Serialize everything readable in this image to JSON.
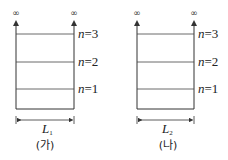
{
  "diagrams": [
    {
      "caption": "(가)",
      "width_label": "L",
      "width_sub": "1",
      "top_symbol": "∞",
      "levels": [
        {
          "n": "n",
          "eq": "=3"
        },
        {
          "n": "n",
          "eq": "=2"
        },
        {
          "n": "n",
          "eq": "=1"
        }
      ]
    },
    {
      "caption": "(나)",
      "width_label": "L",
      "width_sub": "2",
      "top_symbol": "∞",
      "levels": [
        {
          "n": "n",
          "eq": "=3"
        },
        {
          "n": "n",
          "eq": "=2"
        },
        {
          "n": "n",
          "eq": "=1"
        }
      ]
    }
  ]
}
